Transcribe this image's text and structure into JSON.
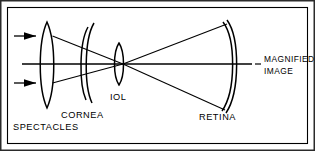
{
  "figure": {
    "border_color": "#1a1a1a",
    "line_color": "#000000",
    "background": "#ffffff",
    "labels": {
      "spectacles": "SPECTACLES",
      "cornea": "CORNEA",
      "iol": "IOL",
      "retina": "RETINA",
      "magnified_line1": "MAGNIFIED",
      "magnified_line2": "IMAGE"
    },
    "components": [
      {
        "name": "spectacle-lens",
        "label": "SPECTACLES",
        "type": "biconvex-lens",
        "center_x": 47,
        "top_y": 22,
        "bottom_y": 108
      },
      {
        "name": "cornea",
        "label": "CORNEA",
        "type": "double-arc",
        "center_x": 90,
        "top_y": 23,
        "bottom_y": 103
      },
      {
        "name": "iol",
        "label": "IOL",
        "type": "biconvex-lens",
        "center_x": 119,
        "top_y": 43,
        "bottom_y": 85
      },
      {
        "name": "retina",
        "label": "RETINA",
        "type": "double-arc",
        "center_x": 232,
        "top_y": 20,
        "bottom_y": 113
      },
      {
        "name": "magnified-image",
        "label": "MAGNIFIED IMAGE",
        "type": "annotation",
        "center_x": 264,
        "center_y": 64
      }
    ],
    "rays": {
      "incoming_arrow_count": 2,
      "incoming_arrow_y": [
        36,
        83
      ],
      "nodal_point_x": 123,
      "nodal_point_y": 64,
      "optical_axis_y": 64
    }
  }
}
